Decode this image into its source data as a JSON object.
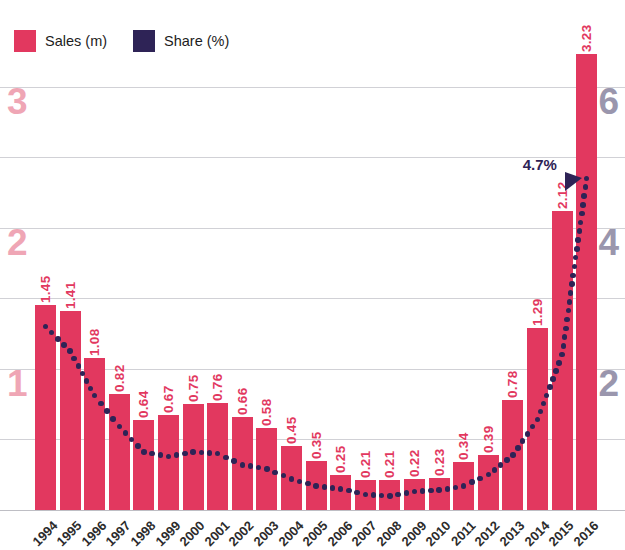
{
  "chart_data": {
    "type": "bar",
    "title": "",
    "xlabel": "",
    "ylabel": "Sales (m)",
    "y2label": "Share (%)",
    "grid": true,
    "legend_position": "top-left",
    "ylim": [
      0,
      3.5
    ],
    "y2lim": [
      0,
      7
    ],
    "yticks": [
      "1",
      "2",
      "3"
    ],
    "ytick_values": [
      1,
      2,
      3
    ],
    "y2ticks": [
      "2",
      "4",
      "6"
    ],
    "y2tick_values": [
      2,
      4,
      6
    ],
    "categories": [
      "1994",
      "1995",
      "1996",
      "1997",
      "1998",
      "1999",
      "2000",
      "2001",
      "2002",
      "2003",
      "2004",
      "2005",
      "2006",
      "2007",
      "2008",
      "2009",
      "2010",
      "2011",
      "2012",
      "2013",
      "2014",
      "2015",
      "2016"
    ],
    "series": [
      {
        "name": "Sales (m)",
        "type": "bar",
        "color": "#e2385f",
        "values": [
          1.45,
          1.41,
          1.08,
          0.82,
          0.64,
          0.67,
          0.75,
          0.76,
          0.66,
          0.58,
          0.45,
          0.35,
          0.25,
          0.21,
          0.21,
          0.22,
          0.23,
          0.34,
          0.39,
          0.78,
          1.29,
          2.12,
          3.23
        ],
        "labels": [
          "1.45",
          "1.41",
          "1.08",
          "0.82",
          "0.64",
          "0.67",
          "0.75",
          "0.76",
          "0.66",
          "0.58",
          "0.45",
          "0.35",
          "0.25",
          "0.21",
          "0.21",
          "0.22",
          "0.23",
          "0.34",
          "0.39",
          "0.78",
          "1.29",
          "2.12",
          "3.23"
        ]
      },
      {
        "name": "Share (%)",
        "type": "line",
        "style": "dotted",
        "axis": "right",
        "color": "#2e2356",
        "values": [
          2.6,
          2.25,
          1.62,
          1.18,
          0.82,
          0.76,
          0.82,
          0.8,
          0.64,
          0.58,
          0.44,
          0.34,
          0.3,
          0.22,
          0.2,
          0.26,
          0.28,
          0.34,
          0.5,
          0.78,
          1.28,
          2.2,
          4.7
        ]
      }
    ],
    "annotations": [
      {
        "text": "4.7%",
        "series": "Share (%)",
        "category": "2016",
        "value": 4.7
      }
    ]
  },
  "legend": {
    "items": [
      {
        "label": "Sales (m)",
        "color": "#e2385f",
        "swatch_name": "legend-swatch-sales"
      },
      {
        "label": "Share (%)",
        "color": "#2e2356",
        "swatch_name": "legend-swatch-share"
      }
    ]
  },
  "colors": {
    "bar": "#e2385f",
    "line": "#2e2356",
    "axis_left_text": "#efa6b5",
    "axis_right_text": "#9a96ad",
    "gridline": "#c9c9cf",
    "background": "#ffffff"
  }
}
